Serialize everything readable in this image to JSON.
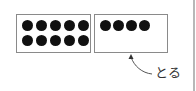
{
  "diagram": {
    "left_box": {
      "dot_count": 10,
      "rows": 2,
      "cols": 5
    },
    "right_box": {
      "dot_count": 4,
      "rows": 1,
      "cols": 4
    },
    "arrow_label": "とる",
    "colors": {
      "dot": "#111111",
      "border": "#8a8a8a",
      "arrow": "#555555"
    }
  }
}
